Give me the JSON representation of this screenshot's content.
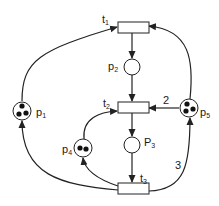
{
  "diagram": {
    "type": "petri-net",
    "colors": {
      "stroke": "#222222",
      "fill": "#ffffff",
      "token": "#111111"
    },
    "places": [
      {
        "id": "p1",
        "base": "p",
        "sub": "1",
        "tokens": 3
      },
      {
        "id": "p2",
        "base": "p",
        "sub": "2",
        "tokens": 0
      },
      {
        "id": "p3",
        "base": "P",
        "sub": "3",
        "tokens": 0
      },
      {
        "id": "p4",
        "base": "p",
        "sub": "4",
        "tokens": 2
      },
      {
        "id": "p5",
        "base": "p",
        "sub": "5",
        "tokens": 3
      }
    ],
    "transitions": [
      {
        "id": "t1",
        "base": "t",
        "sub": "1"
      },
      {
        "id": "t2",
        "base": "t",
        "sub": "2"
      },
      {
        "id": "t3",
        "base": "t",
        "sub": "3"
      }
    ],
    "arcs": [
      {
        "from": "p1",
        "to": "t1",
        "weight": ""
      },
      {
        "from": "p5",
        "to": "t1",
        "weight": ""
      },
      {
        "from": "t1",
        "to": "p2",
        "weight": ""
      },
      {
        "from": "p2",
        "to": "t2",
        "weight": ""
      },
      {
        "from": "p5",
        "to": "t2",
        "weight": "2"
      },
      {
        "from": "p4",
        "to": "t2",
        "weight": ""
      },
      {
        "from": "t2",
        "to": "p3",
        "weight": ""
      },
      {
        "from": "p3",
        "to": "t3",
        "weight": ""
      },
      {
        "from": "t3",
        "to": "p1",
        "weight": ""
      },
      {
        "from": "t3",
        "to": "p4",
        "weight": ""
      },
      {
        "from": "t3",
        "to": "p5",
        "weight": "3"
      }
    ]
  }
}
